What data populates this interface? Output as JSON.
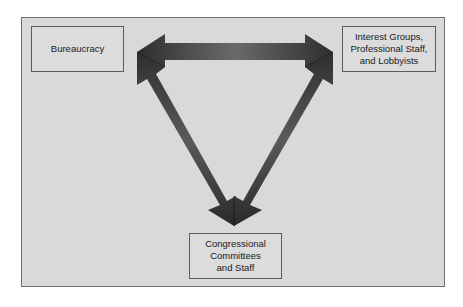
{
  "diagram": {
    "type": "iron-triangle",
    "background_color": "#d9d9d9",
    "arrow_color": "#3a3a3a",
    "nodes": [
      {
        "id": "bureaucracy",
        "label": "Bureaucracy"
      },
      {
        "id": "interest_groups",
        "label": "Interest Groups,\nProfessional Staff,\nand Lobbyists"
      },
      {
        "id": "congress",
        "label": "Congressional\nCommittees\nand Staff"
      }
    ],
    "edges": [
      {
        "from": "bureaucracy",
        "to": "interest_groups",
        "direction": "bidirectional"
      },
      {
        "from": "bureaucracy",
        "to": "congress",
        "direction": "bidirectional"
      },
      {
        "from": "interest_groups",
        "to": "congress",
        "direction": "bidirectional"
      }
    ]
  }
}
